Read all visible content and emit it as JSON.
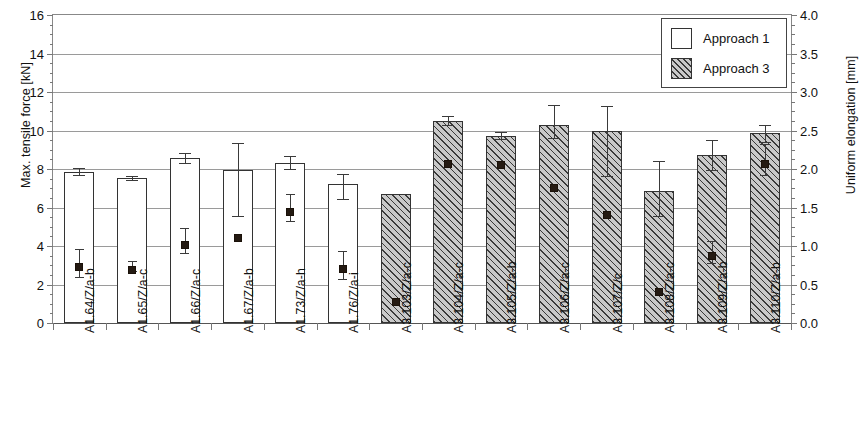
{
  "chart_data": {
    "type": "bar",
    "title": "",
    "xlabel": "",
    "ylabel": "Max. tensile force [kN]",
    "y2label": "Uniform elongation [mm]",
    "ylim": [
      0,
      16
    ],
    "y2lim": [
      0.0,
      4.0
    ],
    "ytick_labels": [
      "16",
      "14",
      "12",
      "10",
      "8",
      "6",
      "4",
      "2",
      "0"
    ],
    "ytick_values": [
      16,
      14,
      12,
      10,
      8,
      6,
      4,
      2,
      0
    ],
    "y2tick_labels": [
      "4.0",
      "3.5",
      "3.0",
      "2.5",
      "2.0",
      "1.5",
      "1.0",
      "0.5",
      "0.0"
    ],
    "y2tick_values": [
      4.0,
      3.5,
      3.0,
      2.5,
      2.0,
      1.5,
      1.0,
      0.5,
      0.0
    ],
    "grid": true,
    "legend_position": "top-right",
    "legend": [
      {
        "label": "Approach 1",
        "pattern": "open"
      },
      {
        "label": "Approach 3",
        "pattern": "hatched"
      }
    ],
    "categories": [
      "A1.64/Z/a-b",
      "A1.65/Z/a-c",
      "A1.66/Z/a-c",
      "A1.67/Z/a-b",
      "A1.73/Z/a-h",
      "A1.76/Z/a-i",
      "A3.103/Z/a-c",
      "A3.104/Z/a-c",
      "A3.105/Z/a-b",
      "A3.106/Z/a-c",
      "A3.107/Z/c",
      "A3.108/Z/a-c",
      "A3.109/Z/a-b",
      "A3.110/Z/a-b"
    ],
    "series": [
      {
        "name": "Max. tensile force",
        "axis": "left",
        "unit": "kN",
        "render": "bar",
        "group": [
          "Approach 1",
          "Approach 1",
          "Approach 1",
          "Approach 1",
          "Approach 1",
          "Approach 1",
          "Approach 3",
          "Approach 3",
          "Approach 3",
          "Approach 3",
          "Approach 3",
          "Approach 3",
          "Approach 3",
          "Approach 3"
        ],
        "values": [
          7.85,
          7.55,
          8.55,
          7.95,
          8.3,
          7.2,
          6.7,
          10.5,
          9.7,
          10.3,
          10.0,
          6.85,
          8.75,
          9.85
        ],
        "err_low": [
          0.15,
          0.1,
          0.25,
          2.4,
          0.3,
          0.75,
          0.0,
          0.2,
          0.15,
          0.7,
          2.35,
          1.3,
          0.8,
          0.45
        ],
        "err_high": [
          0.2,
          0.1,
          0.3,
          1.4,
          0.35,
          0.55,
          0.0,
          0.25,
          0.2,
          1.0,
          1.25,
          1.55,
          0.75,
          0.45
        ]
      },
      {
        "name": "Uniform elongation",
        "axis": "right",
        "unit": "mm",
        "render": "marker",
        "values": [
          0.78,
          0.74,
          1.07,
          1.15,
          1.5,
          0.75,
          0.32,
          2.12,
          2.11,
          1.8,
          1.46,
          0.45,
          0.92,
          2.12
        ],
        "err_low": [
          0.18,
          0.06,
          0.16,
          0.0,
          0.18,
          0.18,
          0.0,
          0.0,
          0.0,
          0.0,
          0.0,
          0.0,
          0.14,
          0.2
        ],
        "err_high": [
          0.18,
          0.06,
          0.16,
          0.0,
          0.18,
          0.18,
          0.0,
          0.0,
          0.0,
          0.0,
          0.0,
          0.0,
          0.14,
          0.2
        ]
      }
    ]
  }
}
